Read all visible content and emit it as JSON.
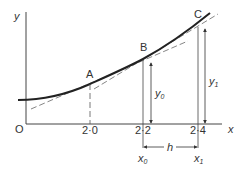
{
  "diagram": {
    "axes": {
      "origin_label": "O",
      "x_label": "x",
      "y_label": "y"
    },
    "points": [
      {
        "label": "A",
        "x_tick": "2·0"
      },
      {
        "label": "B",
        "x_tick": "2·2"
      },
      {
        "label": "C",
        "x_tick": "2·4"
      }
    ],
    "ordinates": {
      "y0": {
        "base": "y",
        "sub": "0"
      },
      "y1": {
        "base": "y",
        "sub": "1"
      }
    },
    "abscissae": {
      "x0": {
        "base": "x",
        "sub": "0"
      },
      "x1": {
        "base": "x",
        "sub": "1"
      }
    },
    "interval_label": "h",
    "colors": {
      "curve": "#222222",
      "axis": "#444444",
      "dashed": "#666666"
    }
  }
}
